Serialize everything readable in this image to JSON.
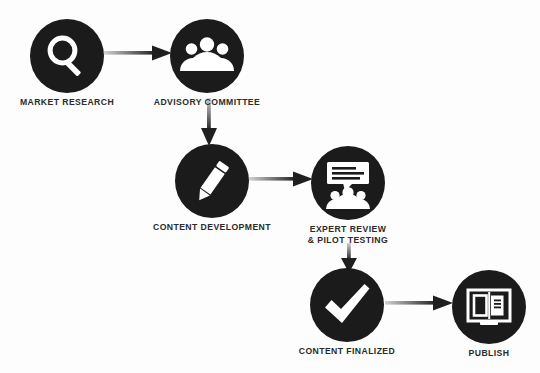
{
  "diagram": {
    "background_color": "#fdfdfd",
    "node_color": "#1b1b1b",
    "icon_color": "#ffffff",
    "label_color": "#2b2b2b",
    "arrow_color_start": "#c9c9c9",
    "arrow_color_end": "#1b1b1b",
    "nodes": [
      {
        "id": "market-research",
        "label": "MARKET RESEARCH",
        "icon": "magnifier-icon",
        "x": 30,
        "y": 19
      },
      {
        "id": "advisory-committee",
        "label": "ADVISORY COMMITTEE",
        "icon": "people-group-icon",
        "x": 170,
        "y": 19
      },
      {
        "id": "content-development",
        "label": "CONTENT DEVELOPMENT",
        "icon": "pencil-icon",
        "x": 175,
        "y": 144
      },
      {
        "id": "expert-review",
        "label": "EXPERT REVIEW\n& PILOT TESTING",
        "icon": "presentation-audience-icon",
        "x": 311,
        "y": 146
      },
      {
        "id": "content-finalized",
        "label": "CONTENT FINALIZED",
        "icon": "checkmark-icon",
        "x": 310,
        "y": 268
      },
      {
        "id": "publish",
        "label": "PUBLISH",
        "icon": "open-book-icon",
        "x": 452,
        "y": 270
      }
    ],
    "arrows": [
      {
        "id": "arrow-research-to-committee",
        "from": "market-research",
        "to": "advisory-committee",
        "direction": "right"
      },
      {
        "id": "arrow-committee-to-development",
        "from": "advisory-committee",
        "to": "content-development",
        "direction": "down"
      },
      {
        "id": "arrow-development-to-review",
        "from": "content-development",
        "to": "expert-review",
        "direction": "right"
      },
      {
        "id": "arrow-review-to-finalized",
        "from": "expert-review",
        "to": "content-finalized",
        "direction": "down"
      },
      {
        "id": "arrow-finalized-to-publish",
        "from": "content-finalized",
        "to": "publish",
        "direction": "right"
      }
    ]
  }
}
